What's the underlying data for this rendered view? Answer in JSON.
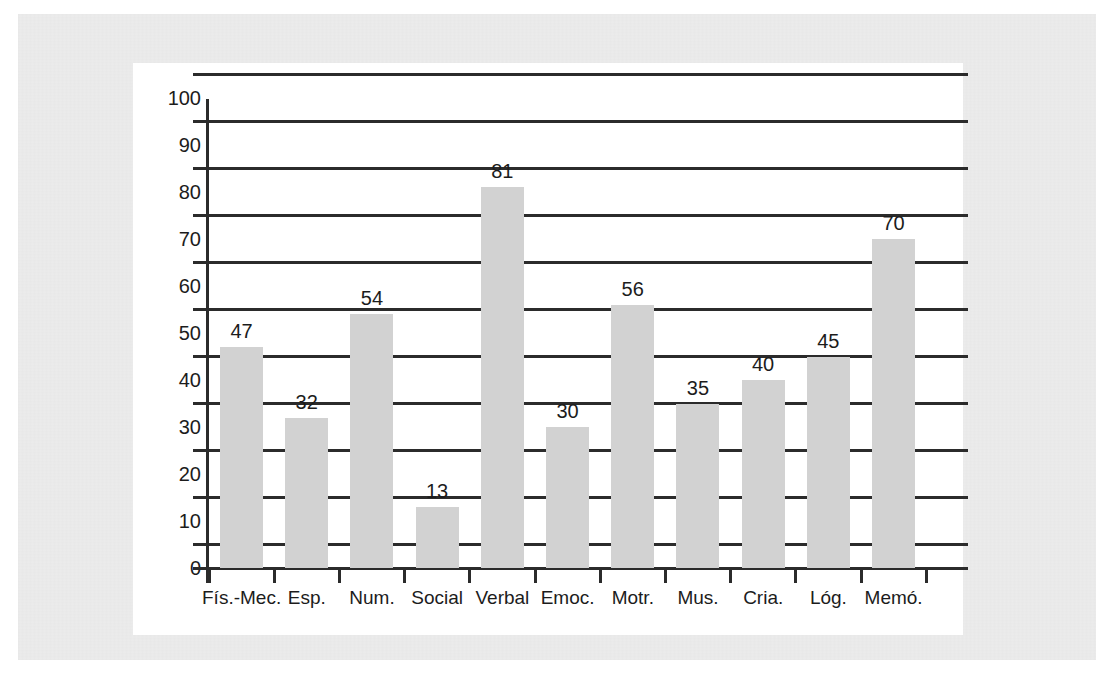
{
  "chart_data": {
    "type": "bar",
    "title": "",
    "subtitle": "",
    "xlabel": "",
    "ylabel": "",
    "categories": [
      "Fís.-Mec.",
      "Esp.",
      "Num.",
      "Social",
      "Verbal",
      "Emoc.",
      "Motr.",
      "Mus.",
      "Cria.",
      "Lóg.",
      "Memó."
    ],
    "values": [
      47,
      32,
      54,
      13,
      81,
      30,
      56,
      35,
      40,
      45,
      70
    ],
    "y_tick_labels": [
      "0",
      "10",
      "20",
      "30",
      "40",
      "50",
      "60",
      "70",
      "80",
      "90",
      "100"
    ],
    "y_tick_values": [
      0,
      10,
      20,
      30,
      40,
      50,
      60,
      70,
      80,
      90,
      100
    ],
    "gridline_values": [
      5,
      15,
      25,
      35,
      45,
      55,
      65,
      75,
      85,
      95,
      105
    ],
    "ylim": [
      0,
      105
    ],
    "grid": true,
    "legend": false,
    "legend_position": "none",
    "bar_color": "#d2d2d2",
    "axis_color": "#2b2b2b",
    "text_color": "#1c1c1c",
    "show_value_labels": true
  },
  "page": {
    "background_color": "#ececec",
    "panel_color": "#ffffff",
    "ghost_left": "",
    "ghost_right": "",
    "ghost_top": "",
    "ghost_bottom": ""
  }
}
